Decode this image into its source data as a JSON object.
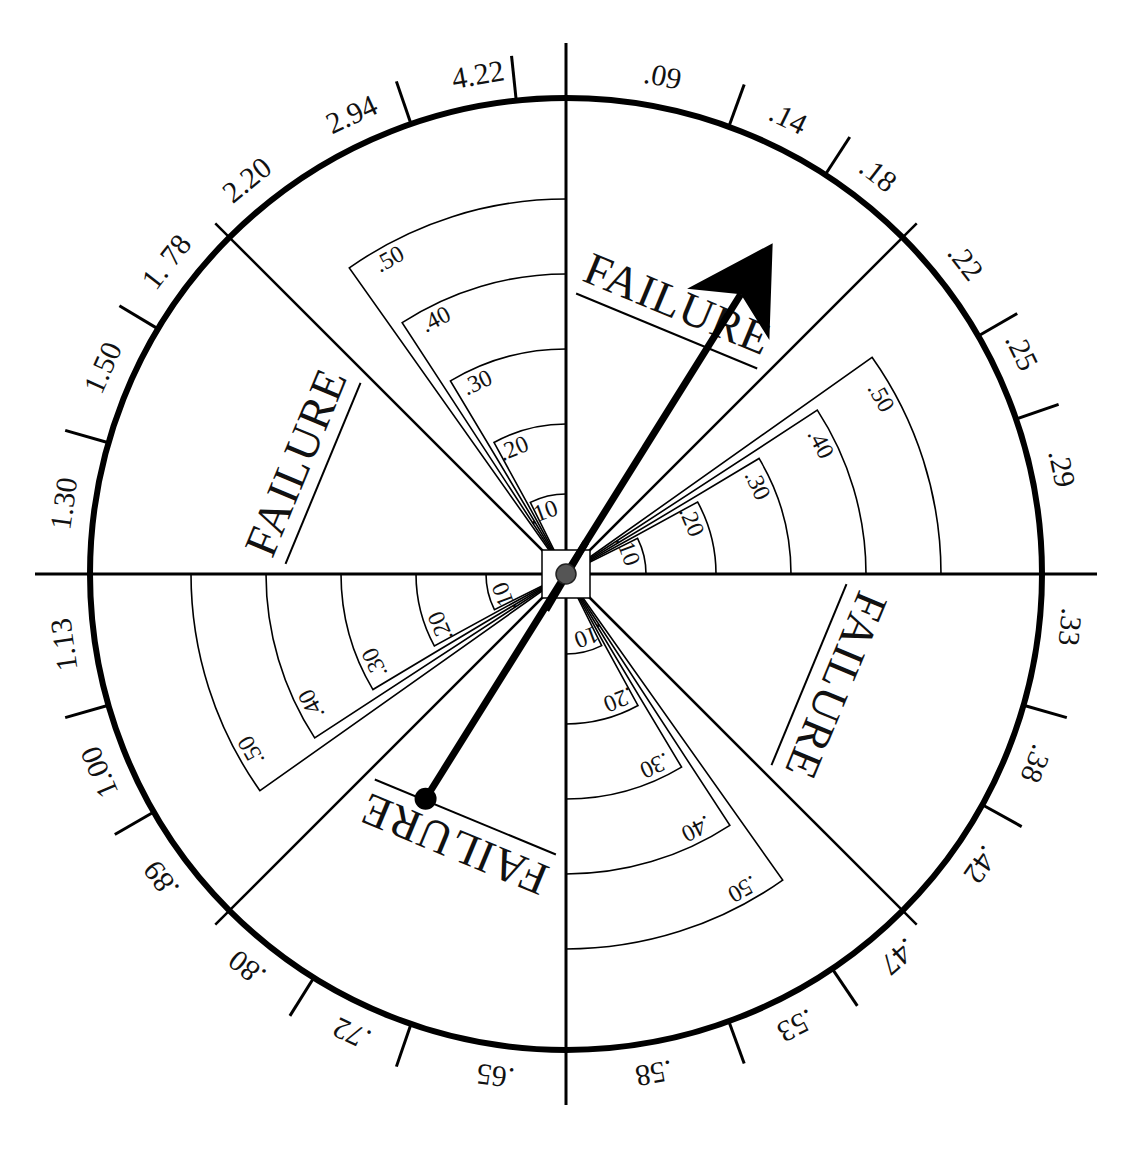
{
  "spinner": {
    "center": [
      566,
      574
    ],
    "outer_radius": 476,
    "line_color": "#000000",
    "background": "#ffffff",
    "outer_ring_labels": [
      {
        "text": ".09",
        "angle": 11
      },
      {
        "text": ".14",
        "angle": 26
      },
      {
        "text": ".18",
        "angle": 38
      },
      {
        "text": ".22",
        "angle": 52
      },
      {
        "text": ".25",
        "angle": 64
      },
      {
        "text": ".29",
        "angle": 78
      },
      {
        "text": ".33",
        "angle": 96
      },
      {
        "text": ".38",
        "angle": 112
      },
      {
        "text": ".42",
        "angle": 125
      },
      {
        "text": ".47",
        "angle": 139
      },
      {
        "text": ".53",
        "angle": 153
      },
      {
        "text": ".58",
        "angle": 170
      },
      {
        "text": ".65",
        "angle": 188
      },
      {
        "text": ".72",
        "angle": 205
      },
      {
        "text": ".80",
        "angle": 219
      },
      {
        "text": ".89",
        "angle": 233
      },
      {
        "text": "1.00",
        "angle": 247
      },
      {
        "text": "1.13",
        "angle": 262
      },
      {
        "text": "1.30",
        "angle": 278
      },
      {
        "text": "1.50",
        "angle": 294
      },
      {
        "text": "1. 78",
        "angle": 308
      },
      {
        "text": "2.20",
        "angle": 321
      },
      {
        "text": "2.94",
        "angle": 335
      },
      {
        "text": "4.22",
        "angle": 350
      }
    ],
    "tick_angles": [
      20,
      33,
      60,
      71,
      106,
      119,
      146,
      160,
      199,
      212,
      240,
      254,
      286,
      301,
      341,
      354
    ],
    "divider_angles": [
      0,
      45,
      90,
      135,
      180,
      225,
      270,
      315
    ],
    "failure_wedges": [
      {
        "text": "FAILURE",
        "mid_angle": 22.5
      },
      {
        "text": "FAILURE",
        "mid_angle": 112.5
      },
      {
        "text": "FAILURE",
        "mid_angle": 202.5
      },
      {
        "text": "FAILURE",
        "mid_angle": 292.5
      }
    ],
    "probability_wedges": [
      {
        "mid_angle": 337.5,
        "arcs": [
          ".10",
          ".20",
          ".30",
          ".40",
          ".50"
        ]
      },
      {
        "mid_angle": 67.5,
        "arcs": [
          ".10",
          ".20",
          ".30",
          ".40",
          ".50"
        ]
      },
      {
        "mid_angle": 157.5,
        "arcs": [
          ".10",
          ".20",
          ".30",
          ".40",
          ".50"
        ]
      },
      {
        "mid_angle": 247.5,
        "arcs": [
          ".10",
          ".20",
          ".30",
          ".40",
          ".50"
        ]
      }
    ],
    "arc_radii": [
      80,
      150,
      225,
      300,
      375
    ],
    "pointer": {
      "angle": 32,
      "head_length": 390,
      "tail_length": 265,
      "hub_color": "#555555",
      "tail_dot_color": "#000000"
    }
  }
}
